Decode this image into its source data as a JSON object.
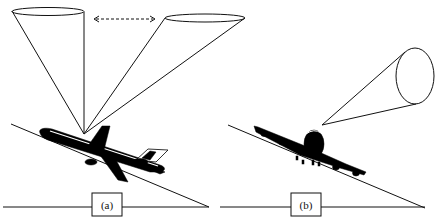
{
  "panels": [
    {
      "id": "a",
      "label": "(a)",
      "description": "Aircraft in banked turn with two sensor cones pointing upward; dashed double-headed arrow indicates cone motion between positions"
    },
    {
      "id": "b",
      "label": "(b)",
      "description": "Aircraft in banked turn with single sensor cone pointing to the side"
    }
  ],
  "colors": {
    "line": "#111111",
    "fill": "#000000",
    "background": "#ffffff"
  }
}
